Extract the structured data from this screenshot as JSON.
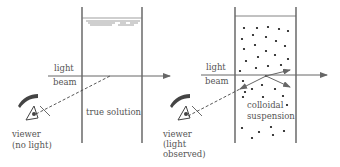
{
  "diagram": {
    "title": "",
    "left_panel": {
      "beam_label_line1": "light",
      "beam_label_line2": "beam",
      "container_label": "true solution",
      "viewer_label_line1": "viewer",
      "viewer_label_line2": "(no light)"
    },
    "right_panel": {
      "beam_label_line1": "light",
      "beam_label_line2": "beam",
      "container_label_line1": "colloidal",
      "container_label_line2": "suspension",
      "viewer_label_line1": "viewer",
      "viewer_label_line2": "(light",
      "viewer_label_line3": "observed)"
    },
    "colors": {
      "line": "#555555",
      "particle": "#111111",
      "background": "#ffffff"
    }
  }
}
